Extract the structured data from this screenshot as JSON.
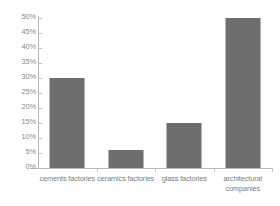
{
  "chart_data": {
    "type": "bar",
    "title": "",
    "subtitle": "",
    "xlabel": "",
    "ylabel": "",
    "categories": [
      "cements factories",
      "ceramics factories",
      "glass factories",
      "architectural companies"
    ],
    "values": [
      30,
      6,
      15,
      50
    ],
    "value_labels": [
      "30%",
      "6%",
      "15%",
      "50%"
    ],
    "ylim": [
      0,
      50
    ],
    "y_ticks": [
      0,
      5,
      10,
      15,
      20,
      25,
      30,
      35,
      40,
      45,
      50
    ],
    "y_tick_labels": [
      "0%",
      "5%",
      "10%",
      "15%",
      "20%",
      "25%",
      "30%",
      "35%",
      "40%",
      "45%",
      "50%"
    ],
    "grid": false,
    "legend": false,
    "legend_position": "none",
    "bar_color": "#6e6e6e",
    "axis_color": "#b9b9b9",
    "tick_label_color": "#8a8a8a",
    "background_color": "#ffffff"
  }
}
